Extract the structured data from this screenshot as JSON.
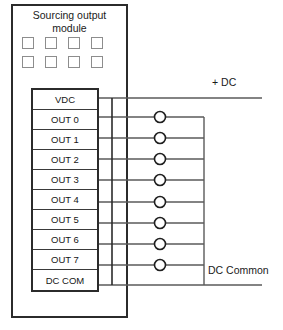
{
  "module": {
    "title": "Sourcing output\nmodule",
    "indicator_count": 8,
    "indicator_rows": 2,
    "indicator_columns": 4
  },
  "terminals": [
    {
      "label": "VDC"
    },
    {
      "label": "OUT 0"
    },
    {
      "label": "OUT 1"
    },
    {
      "label": "OUT 2"
    },
    {
      "label": "OUT 3"
    },
    {
      "label": "OUT 4"
    },
    {
      "label": "OUT 5"
    },
    {
      "label": "OUT 6"
    },
    {
      "label": "OUT 7"
    },
    {
      "label": "DC COM"
    }
  ],
  "wiring": {
    "supply_label": "+ DC",
    "common_label": "DC Common",
    "load_count": 8,
    "load_symbol": "circle"
  },
  "colors": {
    "line": "#2b2b2b",
    "wire": "#5a5a5a",
    "led_border": "#8d8d8d",
    "text": "#151515",
    "background": "#ffffff"
  }
}
